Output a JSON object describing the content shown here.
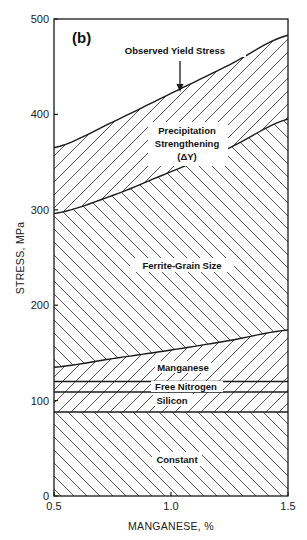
{
  "chart_data": {
    "type": "area",
    "panel_label": "(b)",
    "title": "",
    "xlabel": "MANGANESE, %",
    "ylabel": "STRESS, MPa",
    "xlim": [
      0.5,
      1.5
    ],
    "ylim": [
      0,
      500
    ],
    "x_ticks": [
      0.5,
      1.0,
      1.5
    ],
    "x_tick_labels": [
      "0.5",
      "1.0",
      "1.5"
    ],
    "y_ticks": [
      0,
      100,
      200,
      300,
      400,
      500
    ],
    "y_tick_labels": [
      "0",
      "100",
      "200",
      "300",
      "400",
      "500"
    ],
    "grid": false,
    "legend": "none (regions labeled in place)",
    "stacked": true,
    "x": [
      0.5,
      0.75,
      1.0,
      1.25,
      1.5
    ],
    "series": [
      {
        "name": "Constant",
        "bottom": [
          0,
          0,
          0,
          0,
          0
        ],
        "top": [
          88,
          88,
          88,
          88,
          88
        ],
        "hatch": "backslash"
      },
      {
        "name": "Silicon",
        "bottom": [
          88,
          88,
          88,
          88,
          88
        ],
        "top": [
          109,
          109,
          109,
          109,
          109
        ],
        "hatch": "slash"
      },
      {
        "name": "Free Nitrogen",
        "bottom": [
          109,
          109,
          109,
          109,
          109
        ],
        "top": [
          120,
          120,
          120,
          120,
          120
        ],
        "hatch": "slash"
      },
      {
        "name": "Manganese",
        "bottom": [
          120,
          120,
          120,
          120,
          120
        ],
        "top": [
          135,
          144,
          153,
          163,
          174
        ],
        "hatch": "slash"
      },
      {
        "name": "Ferrite-Grain Size",
        "bottom": [
          135,
          144,
          153,
          163,
          174
        ],
        "top": [
          296,
          315,
          340,
          365,
          395
        ],
        "hatch": "backslash"
      },
      {
        "name": "Precipitation Strengthening (ΔY)",
        "bottom": [
          296,
          315,
          340,
          365,
          395
        ],
        "top": [
          365,
          392,
          422,
          452,
          483
        ],
        "hatch": "slash"
      }
    ],
    "annotations": [
      {
        "text": "Observed Yield Stress",
        "arrow_to": {
          "x": 1.0,
          "y": 422
        }
      }
    ]
  },
  "labels": {
    "panel": "(b)",
    "observed_yield": "Observed Yield Stress",
    "precip_line1": "Precipitation",
    "precip_line2": "Strengthening",
    "precip_line3": "(ΔY)",
    "ferrite": "Ferrite-Grain Size",
    "manganese": "Manganese",
    "free_nitrogen": "Free Nitrogen",
    "silicon": "Silicon",
    "constant": "Constant",
    "xlabel": "MANGANESE, %",
    "ylabel": "STRESS, MPa"
  },
  "colors": {
    "ink": "#1a1a1a",
    "background": "#ffffff"
  }
}
